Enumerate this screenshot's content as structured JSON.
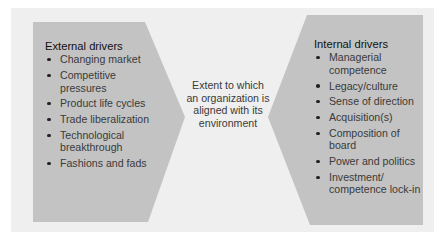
{
  "diagram": {
    "colors": {
      "frame": "#efefef",
      "shape": "#c3c3c3",
      "text": "#3a3a3a",
      "heading": "#111111"
    },
    "external": {
      "title": "External drivers",
      "items": [
        "Changing market",
        "Competitive pressures",
        "Product life cycles",
        "Trade liberalization",
        "Technological breakthrough",
        "Fashions and fads"
      ]
    },
    "center": {
      "text": "Extent to which an organization is aligned with its environment"
    },
    "internal": {
      "title": "Internal drivers",
      "items": [
        "Managerial competence",
        "Legacy/culture",
        "Sense of direction",
        "Acquisition(s)",
        "Composition of board",
        "Power and politics",
        "Investment/ competence lock-in"
      ]
    }
  }
}
